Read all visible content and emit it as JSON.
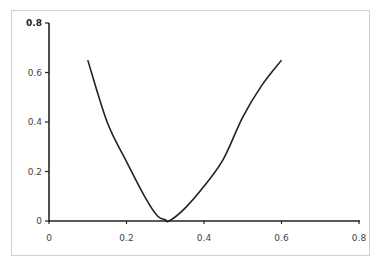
{
  "chart_data": {
    "type": "line",
    "title": "",
    "xlabel": "",
    "ylabel": "",
    "xlim": [
      0,
      0.8
    ],
    "ylim": [
      0,
      0.8
    ],
    "grid": false,
    "legend": null,
    "x_ticks": [
      "0",
      "0.2",
      "0.4",
      "0.6",
      "0.8"
    ],
    "y_ticks": [
      "0",
      "0.2",
      "0.4",
      "0.6",
      "0.8"
    ],
    "series": [
      {
        "name": "curve",
        "color": "#222222",
        "x": [
          0.1,
          0.15,
          0.2,
          0.25,
          0.28,
          0.3,
          0.31,
          0.35,
          0.4,
          0.45,
          0.5,
          0.55,
          0.6
        ],
        "y": [
          0.65,
          0.4,
          0.24,
          0.09,
          0.02,
          0.005,
          0.0,
          0.05,
          0.14,
          0.25,
          0.42,
          0.55,
          0.65
        ]
      }
    ]
  }
}
